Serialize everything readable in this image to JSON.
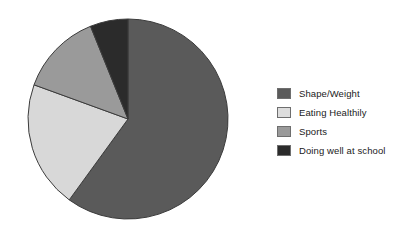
{
  "chart_data": {
    "type": "pie",
    "title": "",
    "subtitle": "",
    "xlabel": "",
    "ylabel": "",
    "grid": false,
    "legend_position": "right",
    "start_angle_deg": 0,
    "direction": "clockwise",
    "center": {
      "cx": 128,
      "cy": 119,
      "r": 100
    },
    "categories": [
      "Shape/Weight",
      "Eating Healthily",
      "Sports",
      "Doing well at school"
    ],
    "values": [
      60,
      20.5,
      13.5,
      6
    ],
    "unit": "%",
    "slices": [
      {
        "label": "Shape/Weight",
        "value": 60,
        "start_deg": 0,
        "end_deg": 216,
        "color": "#5a5a5a",
        "stroke": "#3c3c3c"
      },
      {
        "label": "Eating Healthily",
        "value": 20.5,
        "start_deg": 216,
        "end_deg": 290,
        "color": "#d8d8d8",
        "stroke": "#3c3c3c"
      },
      {
        "label": "Sports",
        "value": 13.5,
        "start_deg": 290,
        "end_deg": 338,
        "color": "#9a9a9a",
        "stroke": "#3c3c3c"
      },
      {
        "label": "Doing well at school",
        "value": 6,
        "start_deg": 338,
        "end_deg": 360,
        "color": "#2b2b2b",
        "stroke": "#3c3c3c"
      }
    ]
  },
  "legend": {
    "items": [
      {
        "label": "Shape/Weight",
        "color": "#5a5a5a"
      },
      {
        "label": "Eating Healthily",
        "color": "#dddddd"
      },
      {
        "label": "Sports",
        "color": "#9a9a9a"
      },
      {
        "label": "Doing well at school",
        "color": "#2b2b2b"
      }
    ]
  }
}
